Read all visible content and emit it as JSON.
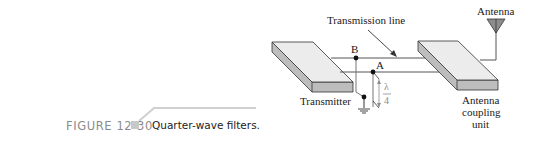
{
  "figure": {
    "number_label": "FIGURE 12-30",
    "caption": "Quarter-wave filters."
  },
  "diagram": {
    "labels": {
      "transmission_line": "Transmission line",
      "antenna": "Antenna",
      "transmitter": "Transmitter",
      "coupling_unit_line1": "Antenna",
      "coupling_unit_line2": "coupling",
      "coupling_unit_line3": "unit",
      "point_a": "A",
      "point_b": "B",
      "lambda": "λ",
      "four": "4"
    },
    "colors": {
      "slab_top": "#ececec",
      "slab_side": "#bdbdbd",
      "outline": "#333333",
      "line_gray": "#777777",
      "annotation_gray": "#8a8a8a",
      "antenna_fill": "#8c8c8c",
      "caption_gray": "#8c8c8c"
    }
  }
}
